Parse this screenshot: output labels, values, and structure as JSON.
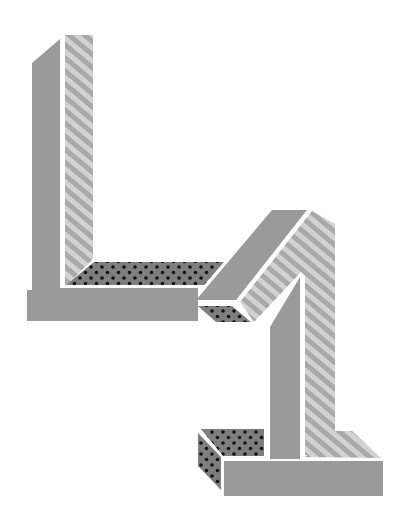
{
  "artwork": {
    "title": "41",
    "description": "Impossible 3D numerals 4 and 1 built from interlocking beams",
    "digits": [
      "4",
      "1"
    ]
  },
  "colors": {
    "background": "#ffffff",
    "solid_face": "#9a9a9a",
    "stripe_light": "#d2d2d2",
    "stripe_dark": "#a9a9a9",
    "dot_face": "#7e7e7e",
    "dot": "#111111",
    "outline_gap": "#ffffff"
  },
  "textures": [
    "solid",
    "diagonal-stripes",
    "polka-dots"
  ]
}
